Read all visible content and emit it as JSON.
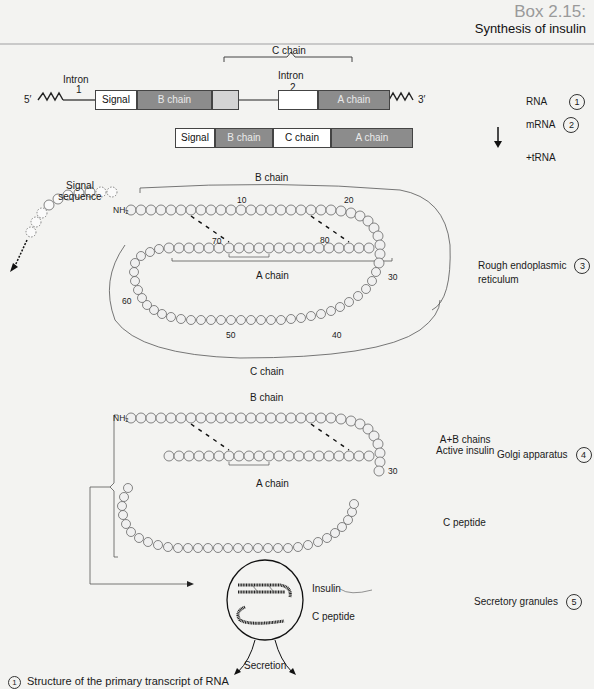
{
  "header": {
    "box_number": "Box 2.15:",
    "title": "Synthesis of insulin"
  },
  "rna_diagram": {
    "five_prime": "5′",
    "three_prime": "3′",
    "c_chain_bracket_label": "C chain",
    "intron1_label": "Intron",
    "intron1_number": "1",
    "intron2_label": "Intron",
    "intron2_number": "2",
    "segments": [
      {
        "label": "Signal",
        "style": "white"
      },
      {
        "label": "B chain",
        "style": "grey"
      },
      {
        "label": "",
        "style": "light"
      },
      {
        "label": "",
        "style": "white"
      },
      {
        "label": "A chain",
        "style": "grey"
      }
    ]
  },
  "mrna_diagram": {
    "segments": [
      {
        "label": "Signal",
        "style": "white"
      },
      {
        "label": "B chain",
        "style": "grey"
      },
      {
        "label": "C chain",
        "style": "white"
      },
      {
        "label": "A chain",
        "style": "grey"
      }
    ]
  },
  "stages": [
    {
      "label": "RNA",
      "number": "1"
    },
    {
      "label": "mRNA",
      "number": "2"
    },
    {
      "label": "+tRNA",
      "number": ""
    },
    {
      "label": "Rough endoplasmic",
      "label2": "reticulum",
      "number": "3"
    },
    {
      "label": "Golgi apparatus",
      "number": "4"
    },
    {
      "label": "Secretory granules",
      "number": "5"
    }
  ],
  "rer_diagram": {
    "signal_sequence_label": "Signal",
    "signal_sequence_label2": "sequence",
    "b_chain_label": "B chain",
    "a_chain_label": "A chain",
    "c_chain_label": "C chain",
    "nh2": "NH₂",
    "disulfide": "S",
    "intra_ss": "S — S",
    "numbers": {
      "n10": "10",
      "n20": "20",
      "n30": "30",
      "n40": "40",
      "n50": "50",
      "n60": "60",
      "n70": "70",
      "n80": "80"
    },
    "b_chain_residues": [
      "Phe",
      "Val",
      "Asn",
      "Gln",
      "His",
      "Leu",
      "Cys",
      "Gly",
      "Ser",
      "His",
      "Leu",
      "Val",
      "Glu",
      "Ala",
      "Leu",
      "Tyr",
      "Leu",
      "Val",
      "Cys",
      "Gly",
      "Glu",
      "Arg",
      "Gly",
      "Phe",
      "Phe",
      "Tyr",
      "Thr",
      "Pro",
      "Lys",
      "Thr"
    ],
    "a_chain_residues": [
      "Gly",
      "Ile",
      "Val",
      "Glu",
      "Gln",
      "Cys",
      "Cys",
      "Thr",
      "Ser",
      "Ile",
      "Cys",
      "Ser",
      "Leu",
      "Tyr",
      "Gln",
      "Leu",
      "Glu",
      "Asn",
      "Tyr",
      "Cys",
      "Asn"
    ],
    "c_chain_residues": [
      "Arg",
      "Arg",
      "Glu",
      "Ala",
      "Glu",
      "Asp",
      "Leu",
      "Gln",
      "Val",
      "Gly",
      "Gln",
      "Val",
      "Glu",
      "Leu",
      "Gly",
      "Gly",
      "Gly",
      "Pro",
      "Gly",
      "Ala",
      "Gly",
      "Ser",
      "Leu",
      "Gln",
      "Pro",
      "Leu",
      "Ala",
      "Leu",
      "Glu",
      "Gly",
      "Ser",
      "Leu",
      "Gln",
      "Lys",
      "Arg"
    ]
  },
  "golgi_diagram": {
    "b_chain_label": "B chain",
    "a_chain_label": "A chain",
    "active_insulin_label1": "A+B chains",
    "active_insulin_label2": "Active insulin",
    "c_peptide_label": "C peptide",
    "nh2": "NH₂",
    "n30": "30"
  },
  "granule_diagram": {
    "insulin_label": "Insulin",
    "c_peptide_label": "C peptide",
    "secretion_label": "Secretion"
  },
  "caption": {
    "number": "1",
    "text": "Structure of the primary transcript of RNA"
  }
}
